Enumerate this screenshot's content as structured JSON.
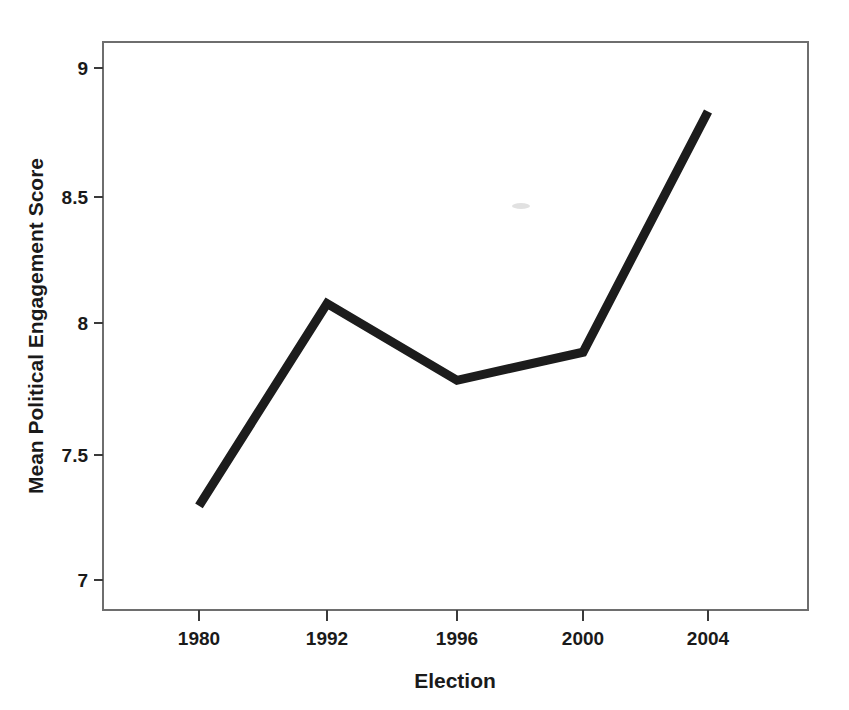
{
  "chart_data": {
    "type": "line",
    "title": "",
    "subtitle": "",
    "xlabel": "Election",
    "ylabel": "Mean Political Engagement Score",
    "categories": [
      "1980",
      "1992",
      "1996",
      "2000",
      "2004"
    ],
    "values": [
      7.29,
      8.08,
      7.78,
      7.89,
      8.83
    ],
    "series": [
      {
        "name": "Mean Political Engagement Score",
        "values": [
          7.29,
          8.08,
          7.78,
          7.89,
          8.83
        ]
      }
    ],
    "x_tick_labels": [
      "1980",
      "1992",
      "1996",
      "2000",
      "2004"
    ],
    "y_tick_labels": [
      "9",
      "8.5",
      "8",
      "7.5",
      "7"
    ],
    "y_tick_values": [
      9,
      8.5,
      8,
      7.5,
      7
    ],
    "ylim": [
      6.79,
      9.18
    ],
    "grid": false,
    "legend": false,
    "legend_position": "none",
    "line_color": "#1c1c1c",
    "frame_color": "#6e6e6e",
    "text_color": "#1a1a1a",
    "background_color": "#ffffff"
  },
  "figure": {
    "axis_titles": {
      "x": "Election",
      "y": "Mean Political Engagement Score"
    },
    "y_ticks": [
      {
        "label": "9"
      },
      {
        "label": "8.5"
      },
      {
        "label": "8"
      },
      {
        "label": "7.5"
      },
      {
        "label": "7"
      }
    ],
    "x_ticks": [
      {
        "label": "1980"
      },
      {
        "label": "1992"
      },
      {
        "label": "1996"
      },
      {
        "label": "2000"
      },
      {
        "label": "2004"
      }
    ],
    "artifact": {
      "name": "scan-smudge",
      "description": ""
    }
  }
}
